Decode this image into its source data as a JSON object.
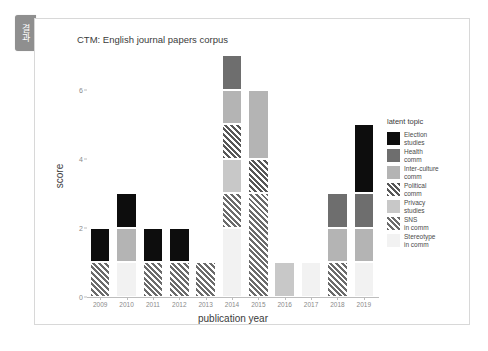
{
  "side_tab": {
    "label": "결과"
  },
  "chart_data": {
    "type": "bar",
    "stacked": true,
    "title": "CTM: English journal papers corpus",
    "xlabel": "publication year",
    "ylabel": "score",
    "ylim": [
      0,
      7
    ],
    "yticks": [
      0,
      2,
      4,
      6
    ],
    "grid": false,
    "legend_position": "right",
    "legend_title": "latent topic",
    "categories": [
      "2009",
      "2010",
      "2011",
      "2012",
      "2013",
      "2014",
      "2015",
      "2016",
      "2017",
      "2018",
      "2019"
    ],
    "series": [
      {
        "name": "Election\nstudies",
        "key": "election-studies",
        "color": "#0d0d0d",
        "hatch": false,
        "values": [
          1,
          1,
          1,
          1,
          0,
          0,
          0,
          0,
          0,
          0,
          2
        ]
      },
      {
        "name": "Health\ncomm",
        "key": "health-comm",
        "color": "#6e6e6e",
        "hatch": false,
        "values": [
          0,
          0,
          0,
          0,
          0,
          1,
          0,
          0,
          0,
          1,
          1
        ]
      },
      {
        "name": "Inter-culture\ncomm",
        "key": "inter-culture-comm",
        "color": "#b4b4b4",
        "hatch": false,
        "values": [
          0,
          1,
          0,
          0,
          0,
          1,
          2,
          0,
          0,
          1,
          1
        ]
      },
      {
        "name": "Political\ncomm",
        "key": "political-comm",
        "color": "#575757",
        "hatch": true,
        "values": [
          0,
          0,
          0,
          0,
          0,
          1,
          1,
          0,
          0,
          0,
          0
        ]
      },
      {
        "name": "Privacy\nstudies",
        "key": "privacy-studies",
        "color": "#c8c8c8",
        "hatch": false,
        "values": [
          0,
          0,
          0,
          0,
          0,
          1,
          0,
          1,
          0,
          0,
          0
        ]
      },
      {
        "name": "SNS\nin comm",
        "key": "sns-in-comm",
        "color": "#6b6b6b",
        "hatch": true,
        "values": [
          1,
          0,
          1,
          1,
          1,
          1,
          3,
          0,
          0,
          1,
          0
        ]
      },
      {
        "name": "Stereotype\nin comm",
        "key": "stereotype-in-comm",
        "color": "#f2f2f2",
        "hatch": false,
        "values": [
          0,
          1,
          0,
          0,
          0,
          2,
          0,
          0,
          1,
          0,
          1
        ]
      }
    ],
    "stack_order_bottom_to_top": [
      "stereotype-in-comm",
      "sns-in-comm",
      "privacy-studies",
      "political-comm",
      "inter-culture-comm",
      "health-comm",
      "election-studies"
    ],
    "bar_totals": [
      2,
      3,
      2,
      2,
      1,
      7,
      6,
      1,
      1,
      3,
      5
    ]
  }
}
